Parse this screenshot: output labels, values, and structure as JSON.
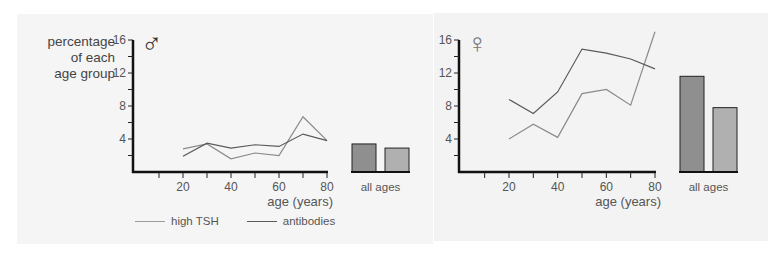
{
  "chart_data": [
    {
      "type": "line",
      "panel": "male",
      "symbol": "♂",
      "title": "",
      "xlabel": "age (years)",
      "ylabel": "percentage of each age group",
      "x": [
        20,
        30,
        40,
        50,
        60,
        70,
        80
      ],
      "xticks": [
        20,
        40,
        60,
        80
      ],
      "yticks": [
        4,
        8,
        12,
        16
      ],
      "ylim": [
        0,
        16
      ],
      "xlim": [
        0,
        80
      ],
      "series": [
        {
          "name": "high TSH",
          "color": "#8a8a8a",
          "values": [
            2.8,
            3.4,
            1.6,
            2.3,
            2.0,
            6.7,
            3.8
          ]
        },
        {
          "name": "antibodies",
          "color": "#5a5a5a",
          "values": [
            1.9,
            3.5,
            2.9,
            3.3,
            3.1,
            4.6,
            3.8
          ]
        }
      ],
      "summary_bars": {
        "label": "all ages",
        "bars": [
          {
            "name": "antibodies",
            "value": 3.4,
            "color": "#8f8f8f"
          },
          {
            "name": "high TSH",
            "value": 2.9,
            "color": "#b0b0b0"
          }
        ]
      }
    },
    {
      "type": "line",
      "panel": "female",
      "symbol": "♀",
      "title": "",
      "xlabel": "age (years)",
      "ylabel": "",
      "x": [
        20,
        30,
        40,
        50,
        60,
        70,
        80
      ],
      "xticks": [
        20,
        40,
        60,
        80
      ],
      "yticks": [
        4,
        8,
        12,
        16
      ],
      "ylim": [
        0,
        16
      ],
      "xlim": [
        0,
        80
      ],
      "series": [
        {
          "name": "high TSH",
          "color": "#8a8a8a",
          "values": [
            4.0,
            5.8,
            4.2,
            9.5,
            10.0,
            8.1,
            17.0
          ]
        },
        {
          "name": "antibodies",
          "color": "#5a5a5a",
          "values": [
            8.8,
            7.1,
            9.7,
            14.9,
            14.4,
            13.7,
            12.5
          ]
        }
      ],
      "summary_bars": {
        "label": "all ages",
        "bars": [
          {
            "name": "antibodies",
            "value": 11.6,
            "color": "#8f8f8f"
          },
          {
            "name": "high TSH",
            "value": 7.8,
            "color": "#b0b0b0"
          }
        ]
      }
    }
  ],
  "male": {
    "ylabel_lines": [
      "percentage",
      "of each",
      "age group"
    ],
    "symbol": "♂",
    "xlabel": "age (years)",
    "bars_label": "all ages"
  },
  "female": {
    "symbol": "♀",
    "xlabel": "age (years)",
    "bars_label": "all ages"
  },
  "legend": {
    "items": [
      {
        "label": "high TSH",
        "color": "#9a9a9a"
      },
      {
        "label": "antibodies",
        "color": "#5a5a5a"
      }
    ]
  }
}
